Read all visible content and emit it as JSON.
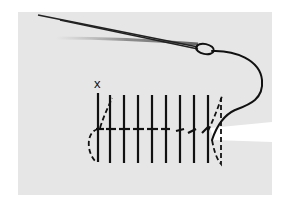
{
  "figure": {
    "start_marker": "x",
    "stitch_count": 9,
    "colors": {
      "fabric": "#e6e6e6",
      "ink": "#111111",
      "background": "#ffffff"
    }
  }
}
